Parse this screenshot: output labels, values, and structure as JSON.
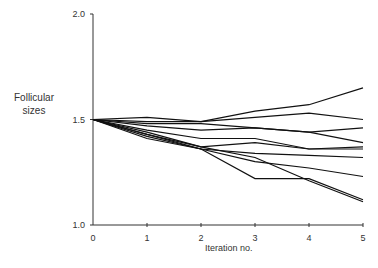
{
  "chart_data": {
    "type": "line",
    "title": "",
    "xlabel": "Iteration no.",
    "ylabel": "Follicular sizes",
    "x": [
      0,
      1,
      2,
      3,
      4,
      5
    ],
    "xticks": [
      "0",
      "1",
      "2",
      "3",
      "4",
      "5"
    ],
    "yticks": [
      "1.0",
      "1.5",
      "2.0"
    ],
    "ylim": [
      1.0,
      2.0
    ],
    "xlim": [
      0,
      5
    ],
    "grid": false,
    "legend": "none",
    "series": [
      {
        "name": "s1",
        "values": [
          1.5,
          1.51,
          1.49,
          1.54,
          1.57,
          1.65
        ]
      },
      {
        "name": "s2",
        "values": [
          1.5,
          1.49,
          1.49,
          1.51,
          1.53,
          1.5
        ]
      },
      {
        "name": "s3",
        "values": [
          1.5,
          1.48,
          1.48,
          1.46,
          1.44,
          1.46
        ]
      },
      {
        "name": "s4",
        "values": [
          1.5,
          1.47,
          1.45,
          1.46,
          1.44,
          1.39
        ]
      },
      {
        "name": "s5",
        "values": [
          1.5,
          1.45,
          1.41,
          1.41,
          1.36,
          1.37
        ]
      },
      {
        "name": "s6",
        "values": [
          1.5,
          1.44,
          1.37,
          1.39,
          1.36,
          1.36
        ]
      },
      {
        "name": "s7",
        "values": [
          1.5,
          1.43,
          1.36,
          1.34,
          1.33,
          1.32
        ]
      },
      {
        "name": "s8",
        "values": [
          1.5,
          1.42,
          1.36,
          1.3,
          1.27,
          1.23
        ]
      },
      {
        "name": "s9",
        "values": [
          1.5,
          1.41,
          1.36,
          1.22,
          1.22,
          1.12
        ]
      },
      {
        "name": "s10",
        "values": [
          1.5,
          1.43,
          1.37,
          1.32,
          1.21,
          1.11
        ]
      }
    ]
  },
  "labels": {
    "ylabel_line1": "Follicular",
    "ylabel_line2": "sizes",
    "xlabel": "Iteration no."
  }
}
